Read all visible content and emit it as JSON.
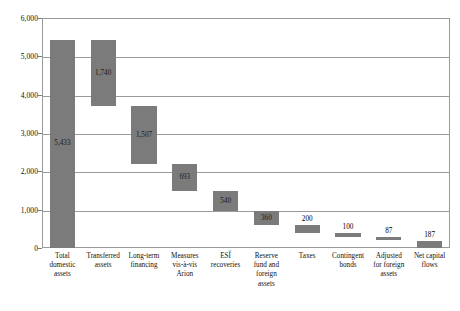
{
  "chart_data": {
    "type": "bar",
    "subtype": "waterfall",
    "title": "",
    "subtitle": "",
    "xlabel": "",
    "ylabel": "",
    "ylim": [
      0,
      6000
    ],
    "ytick_values": [
      0,
      1000,
      2000,
      3000,
      4000,
      5000,
      6000
    ],
    "ytick_labels": [
      "0",
      "1,000",
      "2,000",
      "3,000",
      "4,000",
      "5,000",
      "6,000"
    ],
    "grid": true,
    "legend": "none",
    "bar_color": "#7b7b7b",
    "grid_color": "#9a9a9a",
    "categories": [
      "Total domestic assets",
      "Transferred assets",
      "Long-term financing",
      "Measures vis-à-vis Arion",
      "ESÍ recoveries",
      "Reserve fund and foreign assets",
      "Taxes",
      "Contingent bonds",
      "Adjusted for foreign assets",
      "Net capital flows"
    ],
    "category_lines": [
      [
        "Total",
        "domestic",
        "assets"
      ],
      [
        "Transferred",
        "assets"
      ],
      [
        "Long-term",
        "financing"
      ],
      [
        "Measures",
        "vis-à-vis",
        "Arion"
      ],
      [
        "ESÍ",
        "recoveries"
      ],
      [
        "Reserve",
        "fund and",
        "foreign",
        "assets"
      ],
      [
        "Taxes"
      ],
      [
        "Contingent",
        "bonds"
      ],
      [
        "Adjusted",
        "for foreign",
        "assets"
      ],
      [
        "Net capital",
        "flows"
      ]
    ],
    "values": [
      5433,
      1740,
      1507,
      693,
      540,
      360,
      200,
      100,
      87,
      187
    ],
    "value_labels": [
      "5,433",
      "1,740",
      "1,507",
      "693",
      "540",
      "360",
      "200",
      "100",
      "87",
      "187"
    ],
    "bar_bottoms": [
      0,
      3693,
      2186,
      1493,
      953,
      593,
      393,
      293,
      206,
      0
    ],
    "bar_tops": [
      5433,
      5433,
      3693,
      2186,
      1493,
      953,
      593,
      393,
      293,
      187
    ],
    "label_placement": [
      "inside",
      "inside",
      "inside",
      "inside",
      "inside",
      "inside",
      "above",
      "above",
      "above",
      "above"
    ]
  }
}
